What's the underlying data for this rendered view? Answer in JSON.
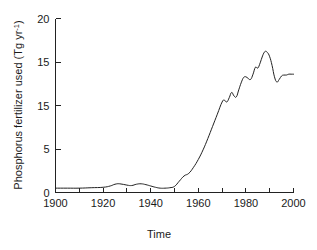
{
  "chart_data": {
    "type": "line",
    "title": "",
    "xlabel": "Time",
    "ylabel": "Phosphorus fertilizer used (Tg yr",
    "ylabel_superscript": "-1",
    "ylabel_suffix": ")",
    "xlim": [
      1900,
      2000
    ],
    "ylim": [
      0,
      20
    ],
    "grid": false,
    "legend": "none",
    "line_color": "#222222",
    "x_major_ticks": [
      1900,
      1920,
      1940,
      1960,
      1980,
      2000
    ],
    "x_major_tick_labels": [
      "1900",
      "1920",
      "1940",
      "1960",
      "1980",
      "2000"
    ],
    "x_minor_ticks": [
      1910,
      1930,
      1950,
      1970,
      1990
    ],
    "y_ticks": [
      0,
      5,
      10,
      15,
      20
    ],
    "y_tick_labels": [
      "0",
      "5",
      "15",
      "15",
      "20"
    ],
    "y_tick_labels_note_top_down": [
      "20",
      "15",
      "15",
      "5",
      "0"
    ],
    "series": [
      {
        "name": "Phosphorus fertilizer used",
        "x": [
          1900,
          1905,
          1910,
          1915,
          1920,
          1923,
          1925,
          1927,
          1930,
          1932,
          1934,
          1936,
          1938,
          1940,
          1942,
          1944,
          1946,
          1948,
          1950,
          1952,
          1954,
          1956,
          1958,
          1960,
          1962,
          1964,
          1966,
          1968,
          1970,
          1971,
          1972,
          1973,
          1974,
          1975,
          1976,
          1977,
          1978,
          1979,
          1980,
          1981,
          1982,
          1983,
          1984,
          1985,
          1986,
          1987,
          1988,
          1989,
          1990,
          1991,
          1992,
          1993,
          1994,
          1995,
          1996,
          1997,
          1998,
          1999,
          2000
        ],
        "values": [
          0.5,
          0.5,
          0.5,
          0.55,
          0.6,
          0.75,
          0.95,
          1.0,
          0.85,
          0.8,
          0.95,
          1.0,
          0.9,
          0.75,
          0.6,
          0.5,
          0.5,
          0.55,
          0.7,
          1.3,
          1.9,
          2.2,
          2.9,
          3.8,
          4.9,
          6.2,
          7.6,
          9.0,
          10.4,
          10.6,
          10.4,
          10.9,
          11.5,
          11.1,
          11.0,
          11.8,
          12.6,
          13.2,
          13.3,
          13.1,
          13.0,
          13.6,
          14.4,
          14.3,
          14.9,
          15.7,
          16.2,
          16.1,
          15.6,
          14.6,
          13.3,
          12.7,
          13.0,
          13.4,
          13.5,
          13.5,
          13.6,
          13.6,
          13.6
        ]
      }
    ]
  }
}
